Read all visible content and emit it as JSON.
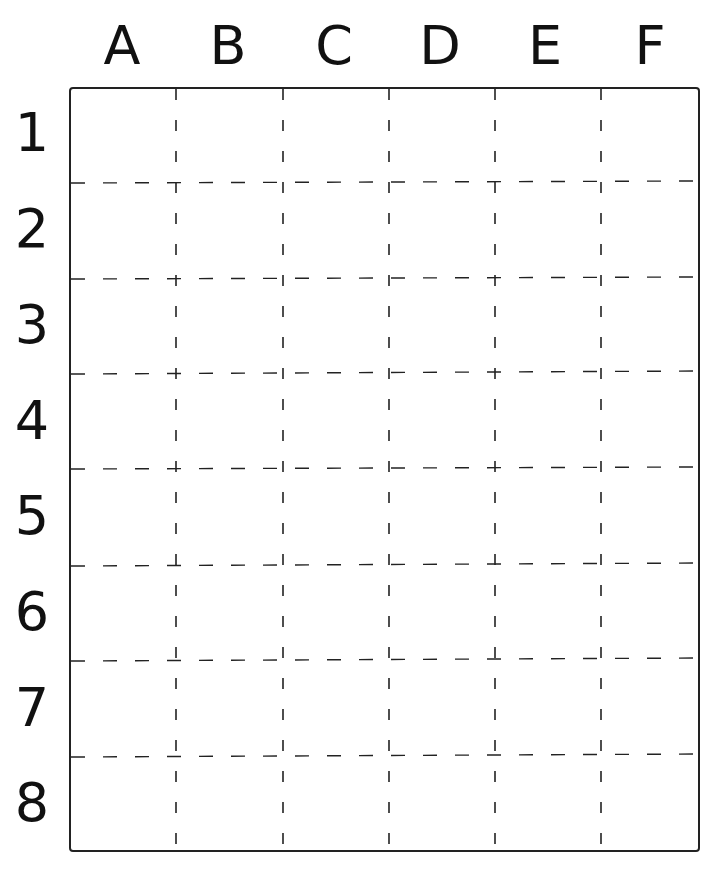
{
  "grid": {
    "columns": [
      "A",
      "B",
      "C",
      "D",
      "E",
      "F"
    ],
    "rows": [
      "1",
      "2",
      "3",
      "4",
      "5",
      "6",
      "7",
      "8"
    ],
    "line_color": "#222222",
    "background": "#ffffff",
    "gridline_style": "dashed",
    "border_style": "solid"
  }
}
